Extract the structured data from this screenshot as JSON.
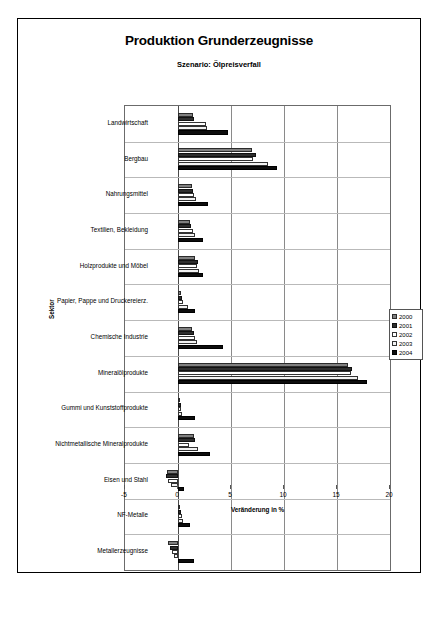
{
  "chart_data": {
    "type": "bar",
    "orientation": "horizontal",
    "title": "Produktion Grunderzeugnisse",
    "subtitle": "Szenario: Ölpreisverfall",
    "xlabel": "Veränderung in %",
    "ylabel": "Sektor",
    "xlim": [
      -5,
      20
    ],
    "xticks": [
      -5,
      0,
      5,
      10,
      15,
      20
    ],
    "xticklabels": [
      "-5",
      "0",
      "5",
      "10",
      "15",
      "20"
    ],
    "grid": true,
    "legend_position": "right",
    "categories": [
      "Landwirtschaft",
      "Bergbau",
      "Nahrungsmittel",
      "Textilien, Bekleidung",
      "Holzprodukte und Möbel",
      "Papier, Pappe und Druckereierz.",
      "Chemische Industrie",
      "Mineralölprodukte",
      "Gummi und Kunststoffprodukte",
      "Nichtmetallische Mineralprodukte",
      "Eisen und Stahl",
      "NF-Metalle",
      "Metallerzeugnisse"
    ],
    "series": [
      {
        "name": "2000",
        "color": "#808080",
        "values": [
          1.4,
          7.0,
          1.3,
          1.1,
          1.6,
          0.3,
          1.3,
          16.0,
          0.2,
          1.5,
          -1.0,
          0.2,
          -0.9
        ]
      },
      {
        "name": "2001",
        "color": "#2e2e2e",
        "values": [
          1.5,
          7.4,
          1.4,
          1.2,
          1.9,
          0.4,
          1.5,
          16.4,
          0.3,
          1.6,
          -1.1,
          0.3,
          -0.8
        ]
      },
      {
        "name": "2002",
        "color": "#ffffff",
        "values": [
          2.6,
          7.1,
          1.5,
          1.4,
          1.8,
          0.5,
          1.6,
          16.3,
          0.3,
          1.0,
          -0.9,
          0.4,
          -0.6
        ]
      },
      {
        "name": "2003",
        "color": "#f2f2f2",
        "values": [
          2.7,
          8.5,
          1.7,
          1.6,
          2.0,
          0.9,
          1.8,
          17.0,
          0.4,
          1.9,
          -0.7,
          0.5,
          -0.4
        ]
      },
      {
        "name": "2004",
        "color": "#0d0d0d",
        "values": [
          4.7,
          9.3,
          2.8,
          2.4,
          2.4,
          1.6,
          4.2,
          17.8,
          1.6,
          3.0,
          0.6,
          1.1,
          1.5
        ]
      }
    ]
  }
}
